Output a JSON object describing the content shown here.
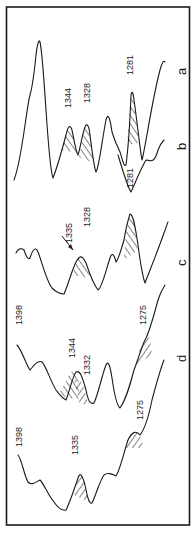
{
  "figure": {
    "type": "spectra-stack",
    "orientation": "rotated-90",
    "trace_letters": [
      "a",
      "b",
      "c",
      "d"
    ],
    "peaks": {
      "a": [
        "1344",
        "1328",
        "1281"
      ],
      "b": [
        "1281"
      ],
      "c": [
        "1335",
        "1328"
      ],
      "d": [
        "1398",
        "1344",
        "1332",
        "1275"
      ],
      "e": [
        "1398",
        "1335",
        "1275"
      ]
    },
    "labels": {
      "a_1344": "1344",
      "a_1328": "1328",
      "a_1281": "1281",
      "b_1281": "1281",
      "c_1335": "1335",
      "c_1328": "1328",
      "d_1398": "1398",
      "d_1344": "1344",
      "d_1332": "1332",
      "d_1275": "1275",
      "e_1398": "1398",
      "e_1335": "1335",
      "e_1275": "1275",
      "letter_a": "a",
      "letter_b": "b",
      "letter_c": "c",
      "letter_d": "d"
    },
    "colors": {
      "ink": "#1a1a1a",
      "background": "#ffffff"
    }
  }
}
